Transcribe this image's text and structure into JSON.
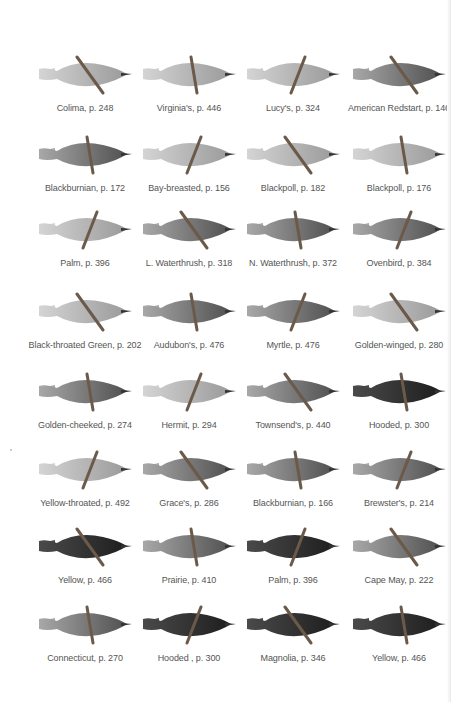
{
  "page": {
    "colors": {
      "background": "#ffffff",
      "caption": "#555555",
      "bird_dark": "#2a2a2a",
      "bird_mid": "#8a8a8a",
      "bird_light": "#cfcfcf",
      "branch": "#6b5a4a"
    }
  },
  "rows": [
    {
      "cells": [
        {
          "name": "Colima",
          "page": "p. 248",
          "caption": "Colima, p. 248",
          "tone": "light"
        },
        {
          "name": "Virginia's",
          "page": "p. 446",
          "caption": "Virginia's, p. 446",
          "tone": "light"
        },
        {
          "name": "Lucy's",
          "page": "p. 324",
          "caption": "Lucy's, p. 324",
          "tone": "light"
        },
        {
          "name": "American Redstart",
          "page": "p. 146",
          "caption": "American Redstart, p. 146",
          "tone": "mid"
        }
      ]
    },
    {
      "cells": [
        {
          "name": "Blackburnian",
          "page": "p. 172",
          "caption": "Blackburnian, p. 172",
          "tone": "mid"
        },
        {
          "name": "Bay-breasted",
          "page": "p. 156",
          "caption": "Bay-breasted, p. 156",
          "tone": "light"
        },
        {
          "name": "Blackpoll",
          "page": "p. 182",
          "caption": "Blackpoll, p. 182",
          "tone": "light"
        },
        {
          "name": "Blackpoll",
          "page": "p. 176",
          "caption": "Blackpoll, p. 176",
          "tone": "light"
        }
      ]
    },
    {
      "cells": [
        {
          "name": "Palm",
          "page": "p. 396",
          "caption": "Palm, p. 396",
          "tone": "light"
        },
        {
          "name": "L. Waterthrush",
          "page": "p. 318",
          "caption": "L. Waterthrush, p. 318",
          "tone": "mid"
        },
        {
          "name": "N. Waterthrush",
          "page": "p. 372",
          "caption": "N. Waterthrush, p. 372",
          "tone": "mid"
        },
        {
          "name": "Ovenbird",
          "page": "p. 384",
          "caption": "Ovenbird, p. 384",
          "tone": "mid"
        }
      ]
    },
    {
      "cells": [
        {
          "name": "Black-throated Green",
          "page": "p. 202",
          "caption": "Black-throated Green, p. 202",
          "tone": "light"
        },
        {
          "name": "Audubon's",
          "page": "p. 476",
          "caption": "Audubon's, p. 476",
          "tone": "mid"
        },
        {
          "name": "Myrtle",
          "page": "p. 476",
          "caption": "Myrtle, p. 476",
          "tone": "mid"
        },
        {
          "name": "Golden-winged",
          "page": "p. 280",
          "caption": "Golden-winged, p. 280",
          "tone": "light"
        }
      ]
    },
    {
      "cells": [
        {
          "name": "Golden-cheeked",
          "page": "p. 274",
          "caption": "Golden-cheeked, p. 274",
          "tone": "mid"
        },
        {
          "name": "Hermit",
          "page": "p. 294",
          "caption": "Hermit, p. 294",
          "tone": "light"
        },
        {
          "name": "Townsend's",
          "page": "p. 440",
          "caption": "Townsend's, p. 440",
          "tone": "mid"
        },
        {
          "name": "Hooded",
          "page": "p. 300",
          "caption": "Hooded, p. 300",
          "tone": "dark"
        }
      ]
    },
    {
      "cells": [
        {
          "name": "Yellow-throated",
          "page": "p. 492",
          "caption": "Yellow-throated, p. 492",
          "tone": "light"
        },
        {
          "name": "Grace's",
          "page": "p. 286",
          "caption": "Grace's, p. 286",
          "tone": "mid"
        },
        {
          "name": "Blackburnian",
          "page": "p. 166",
          "caption": "Blackburnian, p. 166",
          "tone": "mid"
        },
        {
          "name": "Brewster's",
          "page": "p. 214",
          "caption": "Brewster's, p. 214",
          "tone": "mid"
        }
      ]
    },
    {
      "cells": [
        {
          "name": "Yellow",
          "page": "p. 466",
          "caption": "Yellow, p. 466",
          "tone": "dark"
        },
        {
          "name": "Prairie",
          "page": "p. 410",
          "caption": "Prairie, p. 410",
          "tone": "mid"
        },
        {
          "name": "Palm",
          "page": "p. 396",
          "caption": "Palm, p. 396",
          "tone": "dark"
        },
        {
          "name": "Cape May",
          "page": "p. 222",
          "caption": "Cape May, p. 222",
          "tone": "mid"
        }
      ]
    },
    {
      "cells": [
        {
          "name": "Connecticut",
          "page": "p. 270",
          "caption": "Connecticut, p. 270",
          "tone": "mid"
        },
        {
          "name": "Hooded",
          "page": "p. 300",
          "caption": "Hooded , p. 300",
          "tone": "dark"
        },
        {
          "name": "Magnolia",
          "page": "p. 346",
          "caption": "Magnolia, p. 346",
          "tone": "dark"
        },
        {
          "name": "Yellow",
          "page": "p. 466",
          "caption": "Yellow, p. 466",
          "tone": "dark"
        }
      ]
    }
  ]
}
